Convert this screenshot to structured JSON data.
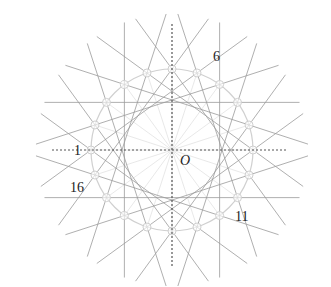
{
  "diagram": {
    "center": {
      "x": 172,
      "y": 150,
      "label": "O"
    },
    "outer_circle_radius": 81,
    "inner_envelope_radius": 50,
    "point_count": 20,
    "chord_step": 6,
    "colors": {
      "lines": "#9a9a9a",
      "circle": "#d0d0d0",
      "axes": "#555555",
      "markers": "#cfcfcf"
    },
    "labels": [
      {
        "text": "1",
        "x": 74,
        "y": 144
      },
      {
        "text": "6",
        "x": 213,
        "y": 50
      },
      {
        "text": "11",
        "x": 235,
        "y": 210
      },
      {
        "text": "16",
        "x": 70,
        "y": 181
      }
    ],
    "axes": {
      "x_from": 52,
      "x_to": 288,
      "y_from": 24,
      "y_to": 266
    }
  }
}
